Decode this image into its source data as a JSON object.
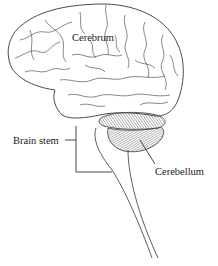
{
  "diagram": {
    "labels": {
      "cerebrum": "Cerebrum",
      "brain_stem": "Brain stem",
      "cerebellum": "Cerebellum"
    },
    "colors": {
      "line": "#4a4a4a",
      "text": "#1a1a1a",
      "background": "#ffffff"
    }
  }
}
